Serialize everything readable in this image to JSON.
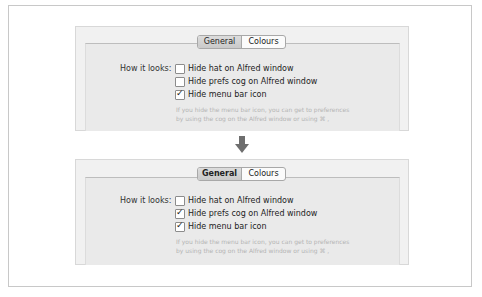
{
  "panels": [
    {
      "tabs": [
        {
          "label": "General",
          "active": true,
          "bold": false
        },
        {
          "label": "Colours",
          "active": false,
          "bold": false
        }
      ],
      "row_label": "How it looks:",
      "options": [
        {
          "label": "Hide hat on Alfred window",
          "checked": false
        },
        {
          "label": "Hide prefs cog on Alfred window",
          "checked": false
        },
        {
          "label": "Hide menu bar icon",
          "checked": true
        }
      ],
      "hint_line1": "If you hide the menu bar icon, you can get to preferences",
      "hint_line2": "by using the cog on the Alfred window or using ⌘ ,"
    },
    {
      "tabs": [
        {
          "label": "General",
          "active": true,
          "bold": true
        },
        {
          "label": "Colours",
          "active": false,
          "bold": false
        }
      ],
      "row_label": "How it looks:",
      "options": [
        {
          "label": "Hide hat on Alfred window",
          "checked": false
        },
        {
          "label": "Hide prefs cog on Alfred window",
          "checked": true
        },
        {
          "label": "Hide menu bar icon",
          "checked": true
        }
      ],
      "hint_line1": "If you hide the menu bar icon, you can get to preferences",
      "hint_line2": "by using the cog on the Alfred window or using ⌘ ,"
    }
  ],
  "transition_icon": "arrow-down-icon",
  "colors": {
    "panel_bg": "#f1f1f1",
    "frame_border": "#c8c8c8",
    "arrow": "#6e6e6e",
    "hint_text": "#b4b4b4"
  }
}
